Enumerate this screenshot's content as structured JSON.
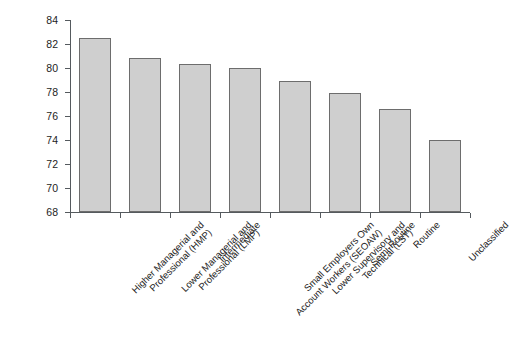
{
  "chart_data": {
    "type": "bar",
    "title": "",
    "subtitle": "",
    "xlabel": "",
    "ylabel": "",
    "ylim": [
      68,
      84
    ],
    "yticks": [
      68,
      70,
      72,
      74,
      76,
      78,
      80,
      82,
      84
    ],
    "grid": false,
    "legend": null,
    "categories": [
      "Higher Managerial and\nProfessional (HMP)",
      "Lower Managerial and\nProfessional (LMP)",
      "Intermediate",
      "Small Employers Own\nAccount Workers (SEOAW)",
      "Lower Supervisory and\nTechnical (LST)",
      "Semi-Routine",
      "Routine",
      "Unclassified"
    ],
    "values": [
      82.5,
      80.8,
      80.35,
      80.0,
      78.9,
      77.95,
      76.6,
      74.0
    ],
    "series": [
      {
        "name": "",
        "values": [
          82.5,
          80.8,
          80.35,
          80.0,
          78.9,
          77.95,
          76.6,
          74.0
        ]
      }
    ],
    "colors": {
      "bar_fill": "#cfcfcf",
      "bar_border": "#6d6d6d",
      "axis": "#555a5e",
      "text": "#1d1d1d",
      "background": "#ffffff"
    }
  }
}
